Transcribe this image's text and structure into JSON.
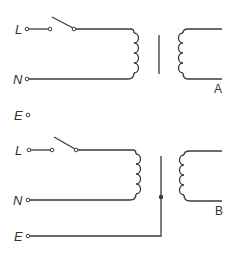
{
  "diagram": {
    "colors": {
      "line": "#3a3a3a",
      "text": "#333333",
      "background": "#ffffff"
    },
    "circuit_a": {
      "terminals": {
        "live": "L",
        "neutral": "N"
      },
      "label": "A",
      "components": [
        "switch",
        "primary-winding",
        "core",
        "secondary-winding"
      ]
    },
    "standalone_earth": {
      "label": "E"
    },
    "circuit_b": {
      "terminals": {
        "live": "L",
        "neutral": "N",
        "earth": "E"
      },
      "label": "B",
      "components": [
        "switch",
        "primary-winding",
        "earthed-core",
        "secondary-winding"
      ]
    }
  }
}
